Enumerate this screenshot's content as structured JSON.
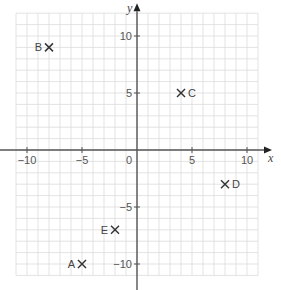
{
  "diagram": {
    "type": "coordinate-grid",
    "axes": {
      "x_label": "x",
      "y_label": "y",
      "origin_label": "0",
      "x_range": [
        -11,
        11
      ],
      "y_range": [
        -11,
        12
      ],
      "x_ticks": [
        {
          "value": -10,
          "label": "−10"
        },
        {
          "value": -5,
          "label": "−5"
        },
        {
          "value": 5,
          "label": "5"
        },
        {
          "value": 10,
          "label": "10"
        }
      ],
      "y_ticks": [
        {
          "value": 10,
          "label": "10"
        },
        {
          "value": 5,
          "label": "5"
        },
        {
          "value": -5,
          "label": "−5"
        },
        {
          "value": -10,
          "label": "−10"
        }
      ]
    },
    "points": [
      {
        "label": "A",
        "x": -5,
        "y": -10,
        "label_side": "left"
      },
      {
        "label": "B",
        "x": -8,
        "y": 9,
        "label_side": "left"
      },
      {
        "label": "C",
        "x": 4,
        "y": 5,
        "label_side": "right"
      },
      {
        "label": "D",
        "x": 8,
        "y": -3,
        "label_side": "right"
      },
      {
        "label": "E",
        "x": -2,
        "y": -7,
        "label_side": "left"
      }
    ],
    "colors": {
      "grid": "#dcdcdc",
      "axis": "#555555",
      "marker": "#333333",
      "text": "#555555"
    }
  }
}
